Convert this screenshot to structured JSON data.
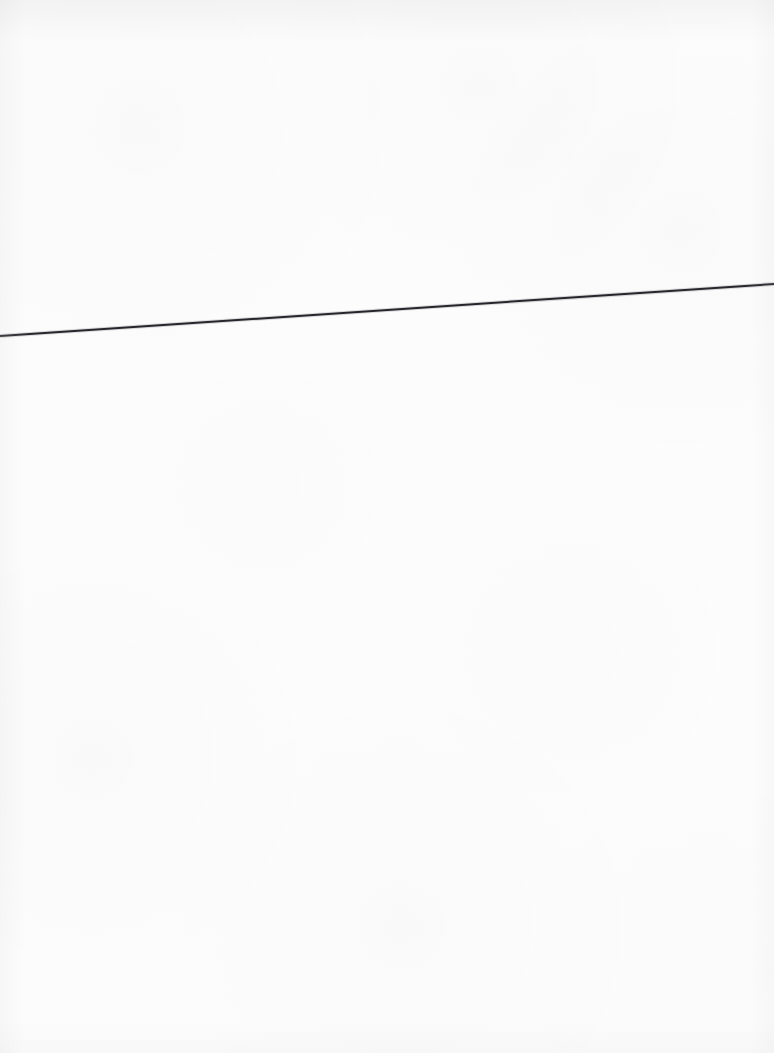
{
  "page": {
    "kind": "scanned-blank-page",
    "width": 774,
    "height": 1053,
    "paper_color": "#fdfdfd",
    "background_color": "#ffffff",
    "visible_text": "",
    "content_description": "Blank scanned sheet of paper containing only a single thin dark diagonal rule spanning the full width."
  },
  "marks": {
    "diagonal_rule": {
      "name": "diagonal-rule",
      "color": "#26262c",
      "stroke_width": 2,
      "x1": 0,
      "y1": 336,
      "x2": 774,
      "y2": 284,
      "spans_full_width": true,
      "direction": "rises left to right",
      "rise_px": 52,
      "angle_degrees": -3.85
    }
  },
  "texture": {
    "grain_opacity": 0.55,
    "vignette_edges": [
      "top",
      "left",
      "right",
      "bottom"
    ],
    "vignette_color": "#000000"
  }
}
